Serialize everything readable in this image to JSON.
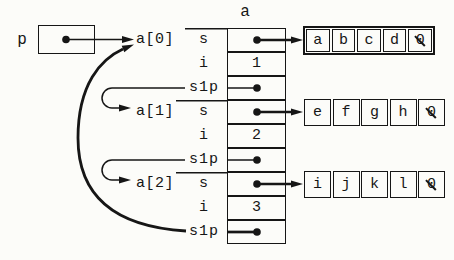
{
  "colors": {
    "ink": "#161616",
    "paper": "#fcfcf9"
  },
  "pointer": {
    "label": "p"
  },
  "array_title": "a",
  "index_labels": [
    "a[0]",
    "a[1]",
    "a[2]"
  ],
  "rows": [
    {
      "field": "s"
    },
    {
      "field": "i",
      "value": "1"
    },
    {
      "field": "s1p"
    },
    {
      "field": "s"
    },
    {
      "field": "i",
      "value": "2"
    },
    {
      "field": "s1p"
    },
    {
      "field": "s"
    },
    {
      "field": "i",
      "value": "3"
    },
    {
      "field": "s1p"
    }
  ],
  "strings": [
    {
      "chars": [
        "a",
        "b",
        "c",
        "d"
      ],
      "nul": "0"
    },
    {
      "chars": [
        "e",
        "f",
        "g",
        "h"
      ],
      "nul": "0"
    },
    {
      "chars": [
        "i",
        "j",
        "k",
        "l"
      ],
      "nul": "0"
    }
  ]
}
